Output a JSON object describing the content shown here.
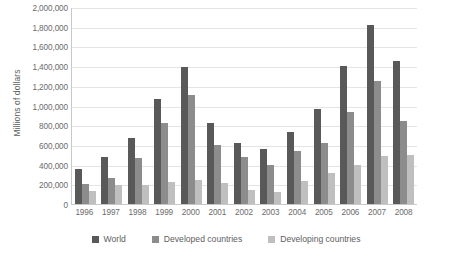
{
  "chart_data": {
    "type": "bar",
    "title": "",
    "xlabel": "",
    "ylabel": "Millions of dollars",
    "ylim": [
      0,
      2000000
    ],
    "ytick_step": 200000,
    "grid": true,
    "legend_position": "bottom",
    "categories": [
      "1996",
      "1997",
      "1998",
      "1999",
      "2000",
      "2001",
      "2002",
      "2003",
      "2004",
      "2005",
      "2006",
      "2007",
      "2008"
    ],
    "ytick_labels": [
      "2,000,000",
      "1,800,000",
      "1,600,000",
      "1,400,000",
      "1,200,000",
      "1,000,000",
      "800,000",
      "600,000",
      "400,000",
      "200,000",
      "0"
    ],
    "series": [
      {
        "name": "World",
        "color": "#595959",
        "values": [
          360000,
          475000,
          675000,
          1070000,
          1390000,
          820000,
          620000,
          560000,
          730000,
          960000,
          1400000,
          1820000,
          1450000
        ]
      },
      {
        "name": "Developed countries",
        "color": "#8c8c8c",
        "values": [
          205000,
          265000,
          465000,
          820000,
          1110000,
          600000,
          480000,
          400000,
          540000,
          620000,
          930000,
          1250000,
          840000
        ]
      },
      {
        "name": "Developing countries",
        "color": "#bfbfbf",
        "values": [
          130000,
          190000,
          190000,
          225000,
          240000,
          215000,
          140000,
          125000,
          230000,
          310000,
          400000,
          490000,
          500000
        ]
      }
    ]
  }
}
